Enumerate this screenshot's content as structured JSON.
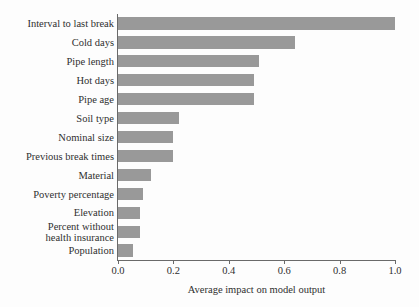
{
  "chart_data": {
    "type": "bar",
    "orientation": "horizontal",
    "title": "",
    "xlabel": "Average impact on model output",
    "ylabel": "",
    "xlim": [
      0.0,
      1.0
    ],
    "xticks": [
      "0.0",
      "0.2",
      "0.4",
      "0.6",
      "0.8",
      "1.0"
    ],
    "xtick_values": [
      0.0,
      0.2,
      0.4,
      0.6,
      0.8,
      1.0
    ],
    "grid": false,
    "legend": "none",
    "bar_color": "#999999",
    "axis_color": "#6a6a6a",
    "background_color": "#fdfdfd",
    "categories": [
      "Interval to last break",
      "Cold days",
      "Pipe length",
      "Hot days",
      "Pipe age",
      "Soil type",
      "Nominal size",
      "Previous break times",
      "Material",
      "Poverty percentage",
      "Elevation",
      "Percent without\nhealth insurance",
      "Population"
    ],
    "values": [
      1.0,
      0.64,
      0.51,
      0.49,
      0.49,
      0.22,
      0.2,
      0.2,
      0.12,
      0.09,
      0.08,
      0.08,
      0.055
    ]
  }
}
